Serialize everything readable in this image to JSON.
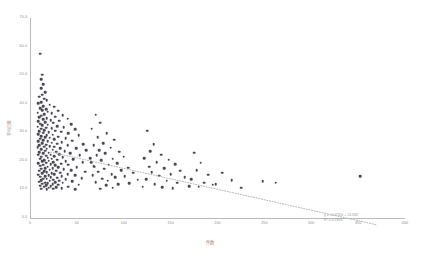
{
  "chart_data": {
    "type": "scatter",
    "title": "",
    "xlabel": "件数",
    "ylabel": "平均日数",
    "xlim": [
      0,
      400
    ],
    "ylim": [
      0,
      70
    ],
    "grid": false,
    "legend": null,
    "x_ticks": [
      "0",
      "50",
      "100",
      "150",
      "200",
      "250",
      "300",
      "350",
      "400"
    ],
    "x_tick_values": [
      0,
      50,
      100,
      150,
      200,
      250,
      300,
      350,
      400
    ],
    "y_ticks": [
      "0.0",
      "10.0",
      "20.0",
      "30.0",
      "40.0",
      "50.0",
      "60.0",
      "70.0"
    ],
    "y_tick_values": [
      0,
      10,
      20,
      30,
      40,
      50,
      60,
      70
    ],
    "marker_color": "#4a4a55",
    "marker_size": 2.6,
    "axis_color": "#b9b9bd",
    "tick_label_color": "#8a8a8f",
    "annotation": {
      "equation": "y = -0.0732x + 24.682",
      "r_squared": "R² = 0.1803",
      "color": "#9a9aa0"
    },
    "trendline": {
      "type": "linear",
      "style": "dotted",
      "color": "#b0b0b5",
      "slope": -0.0732,
      "intercept": 24.682,
      "x_start": 22,
      "x_end": 370
    },
    "points": [
      [
        11,
        57.5
      ],
      [
        13,
        50.2
      ],
      [
        12,
        48.6
      ],
      [
        14,
        46.9
      ],
      [
        12,
        45.4
      ],
      [
        16,
        44.1
      ],
      [
        13,
        43.2
      ],
      [
        10,
        42.4
      ],
      [
        15,
        41.8
      ],
      [
        18,
        41.2
      ],
      [
        12,
        40.6
      ],
      [
        9,
        40.1
      ],
      [
        21,
        39.6
      ],
      [
        14,
        39.2
      ],
      [
        26,
        38.9
      ],
      [
        11,
        38.5
      ],
      [
        17,
        38.1
      ],
      [
        13,
        37.8
      ],
      [
        30,
        37.5
      ],
      [
        19,
        37.2
      ],
      [
        8,
        36.9
      ],
      [
        23,
        36.6
      ],
      [
        15,
        36.3
      ],
      [
        35,
        36.0
      ],
      [
        12,
        35.8
      ],
      [
        27,
        35.5
      ],
      [
        10,
        35.2
      ],
      [
        18,
        35.0
      ],
      [
        40,
        34.8
      ],
      [
        14,
        34.5
      ],
      [
        22,
        34.2
      ],
      [
        31,
        34.0
      ],
      [
        9,
        33.8
      ],
      [
        16,
        33.5
      ],
      [
        25,
        33.3
      ],
      [
        11,
        33.0
      ],
      [
        44,
        32.8
      ],
      [
        19,
        32.6
      ],
      [
        13,
        32.4
      ],
      [
        29,
        32.2
      ],
      [
        8,
        32.0
      ],
      [
        36,
        31.8
      ],
      [
        17,
        31.6
      ],
      [
        23,
        31.4
      ],
      [
        12,
        31.2
      ],
      [
        48,
        31.0
      ],
      [
        15,
        30.8
      ],
      [
        27,
        30.6
      ],
      [
        10,
        30.4
      ],
      [
        33,
        30.2
      ],
      [
        20,
        30.0
      ],
      [
        14,
        29.8
      ],
      [
        41,
        29.6
      ],
      [
        9,
        29.4
      ],
      [
        24,
        29.2
      ],
      [
        18,
        29.0
      ],
      [
        52,
        28.9
      ],
      [
        12,
        28.7
      ],
      [
        30,
        28.5
      ],
      [
        16,
        28.3
      ],
      [
        21,
        28.1
      ],
      [
        38,
        27.9
      ],
      [
        11,
        27.7
      ],
      [
        26,
        27.5
      ],
      [
        14,
        27.3
      ],
      [
        45,
        27.1
      ],
      [
        19,
        26.9
      ],
      [
        9,
        26.8
      ],
      [
        34,
        26.6
      ],
      [
        23,
        26.4
      ],
      [
        13,
        26.2
      ],
      [
        29,
        26.0
      ],
      [
        57,
        25.9
      ],
      [
        17,
        25.7
      ],
      [
        10,
        25.5
      ],
      [
        40,
        25.4
      ],
      [
        21,
        25.2
      ],
      [
        15,
        25.0
      ],
      [
        26,
        24.9
      ],
      [
        8,
        24.7
      ],
      [
        49,
        24.5
      ],
      [
        32,
        24.4
      ],
      [
        18,
        24.2
      ],
      [
        12,
        24.0
      ],
      [
        24,
        23.9
      ],
      [
        60,
        23.7
      ],
      [
        16,
        23.5
      ],
      [
        37,
        23.4
      ],
      [
        28,
        23.2
      ],
      [
        10,
        23.0
      ],
      [
        20,
        22.9
      ],
      [
        43,
        22.7
      ],
      [
        14,
        22.6
      ],
      [
        31,
        22.4
      ],
      [
        22,
        22.2
      ],
      [
        9,
        22.1
      ],
      [
        53,
        21.9
      ],
      [
        17,
        21.8
      ],
      [
        26,
        21.6
      ],
      [
        12,
        21.5
      ],
      [
        35,
        21.3
      ],
      [
        19,
        21.1
      ],
      [
        64,
        21.0
      ],
      [
        23,
        20.8
      ],
      [
        11,
        20.7
      ],
      [
        46,
        20.5
      ],
      [
        29,
        20.4
      ],
      [
        15,
        20.2
      ],
      [
        20,
        20.1
      ],
      [
        38,
        19.9
      ],
      [
        13,
        19.8
      ],
      [
        25,
        19.6
      ],
      [
        56,
        19.5
      ],
      [
        17,
        19.3
      ],
      [
        9,
        19.2
      ],
      [
        33,
        19.0
      ],
      [
        22,
        18.9
      ],
      [
        41,
        18.7
      ],
      [
        14,
        18.6
      ],
      [
        27,
        18.4
      ],
      [
        11,
        18.3
      ],
      [
        68,
        18.1
      ],
      [
        19,
        18.0
      ],
      [
        30,
        17.8
      ],
      [
        50,
        17.7
      ],
      [
        16,
        17.5
      ],
      [
        24,
        17.4
      ],
      [
        12,
        17.2
      ],
      [
        36,
        17.1
      ],
      [
        21,
        16.9
      ],
      [
        44,
        16.8
      ],
      [
        10,
        16.6
      ],
      [
        28,
        16.5
      ],
      [
        15,
        16.3
      ],
      [
        59,
        16.2
      ],
      [
        18,
        16.0
      ],
      [
        32,
        15.9
      ],
      [
        23,
        15.7
      ],
      [
        13,
        15.6
      ],
      [
        40,
        15.4
      ],
      [
        26,
        15.3
      ],
      [
        9,
        15.1
      ],
      [
        20,
        15.0
      ],
      [
        48,
        14.9
      ],
      [
        16,
        14.7
      ],
      [
        34,
        14.6
      ],
      [
        11,
        14.4
      ],
      [
        22,
        14.3
      ],
      [
        29,
        14.1
      ],
      [
        55,
        14.0
      ],
      [
        14,
        13.8
      ],
      [
        18,
        13.7
      ],
      [
        38,
        13.6
      ],
      [
        25,
        13.4
      ],
      [
        12,
        13.3
      ],
      [
        31,
        13.1
      ],
      [
        21,
        13.0
      ],
      [
        45,
        12.9
      ],
      [
        10,
        12.7
      ],
      [
        27,
        12.6
      ],
      [
        16,
        12.4
      ],
      [
        35,
        12.3
      ],
      [
        19,
        12.1
      ],
      [
        13,
        12.0
      ],
      [
        24,
        11.9
      ],
      [
        52,
        11.7
      ],
      [
        30,
        11.6
      ],
      [
        17,
        11.4
      ],
      [
        11,
        11.3
      ],
      [
        22,
        11.1
      ],
      [
        41,
        11.0
      ],
      [
        15,
        10.9
      ],
      [
        28,
        10.7
      ],
      [
        20,
        10.6
      ],
      [
        34,
        10.4
      ],
      [
        12,
        10.3
      ],
      [
        25,
        10.2
      ],
      [
        48,
        10.1
      ],
      [
        18,
        10.0
      ],
      [
        70,
        36.2
      ],
      [
        75,
        33.4
      ],
      [
        66,
        31.2
      ],
      [
        82,
        29.6
      ],
      [
        72,
        28.2
      ],
      [
        90,
        27.4
      ],
      [
        78,
        26.2
      ],
      [
        68,
        25.4
      ],
      [
        86,
        24.6
      ],
      [
        74,
        23.8
      ],
      [
        95,
        23.2
      ],
      [
        80,
        22.6
      ],
      [
        71,
        22.0
      ],
      [
        100,
        21.4
      ],
      [
        88,
        20.8
      ],
      [
        76,
        20.2
      ],
      [
        65,
        19.6
      ],
      [
        93,
        19.2
      ],
      [
        84,
        18.6
      ],
      [
        69,
        18.0
      ],
      [
        105,
        17.6
      ],
      [
        79,
        17.2
      ],
      [
        97,
        16.8
      ],
      [
        73,
        16.2
      ],
      [
        110,
        15.8
      ],
      [
        87,
        15.4
      ],
      [
        67,
        15.0
      ],
      [
        101,
        14.6
      ],
      [
        91,
        14.2
      ],
      [
        77,
        13.8
      ],
      [
        115,
        13.4
      ],
      [
        83,
        13.0
      ],
      [
        70,
        12.6
      ],
      [
        106,
        12.2
      ],
      [
        94,
        11.8
      ],
      [
        81,
        11.4
      ],
      [
        120,
        11.0
      ],
      [
        88,
        10.6
      ],
      [
        75,
        10.3
      ],
      [
        125,
        30.6
      ],
      [
        132,
        25.8
      ],
      [
        128,
        23.4
      ],
      [
        140,
        22.2
      ],
      [
        122,
        21.0
      ],
      [
        148,
        20.4
      ],
      [
        135,
        19.6
      ],
      [
        155,
        18.8
      ],
      [
        127,
        18.0
      ],
      [
        143,
        17.4
      ],
      [
        160,
        16.6
      ],
      [
        130,
        16.0
      ],
      [
        150,
        15.4
      ],
      [
        138,
        14.8
      ],
      [
        165,
        14.2
      ],
      [
        124,
        13.6
      ],
      [
        146,
        13.0
      ],
      [
        157,
        12.4
      ],
      [
        133,
        11.8
      ],
      [
        170,
        11.2
      ],
      [
        141,
        10.8
      ],
      [
        152,
        10.4
      ],
      [
        175,
        22.8
      ],
      [
        182,
        19.4
      ],
      [
        178,
        16.8
      ],
      [
        190,
        15.2
      ],
      [
        172,
        13.6
      ],
      [
        186,
        12.4
      ],
      [
        195,
        11.6
      ],
      [
        180,
        10.9
      ],
      [
        205,
        15.8
      ],
      [
        215,
        13.2
      ],
      [
        198,
        11.8
      ],
      [
        225,
        10.6
      ],
      [
        248,
        12.8
      ],
      [
        262,
        12.4
      ],
      [
        352,
        14.6
      ]
    ]
  }
}
